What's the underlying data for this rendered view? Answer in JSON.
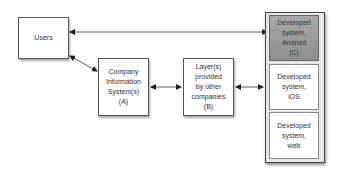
{
  "nodes": {
    "users": {
      "label": "Users"
    },
    "company": {
      "label": "Company\nInformation\nSystem(s)\n(A)"
    },
    "layers": {
      "label": "Layer(s)\nprovided\nby other\ncompanies\n(B)"
    },
    "developed": [
      {
        "label": "Developed\nsystem,\nAndroid\n(C)",
        "highlighted": true
      },
      {
        "label": "Developed\nsystem,\niOS",
        "highlighted": false
      },
      {
        "label": "Developed\nsystem,\nweb",
        "highlighted": false
      }
    ]
  },
  "edges": [
    {
      "from": "users",
      "to": "developed.android",
      "type": "bidirectional"
    },
    {
      "from": "users",
      "to": "company",
      "type": "bidirectional"
    },
    {
      "from": "company",
      "to": "layers",
      "type": "bidirectional"
    },
    {
      "from": "layers",
      "to": "developed",
      "type": "bidirectional"
    }
  ],
  "colors": {
    "highlight": "#9a9a9a",
    "border": "#555555",
    "background": "#ffffff"
  }
}
